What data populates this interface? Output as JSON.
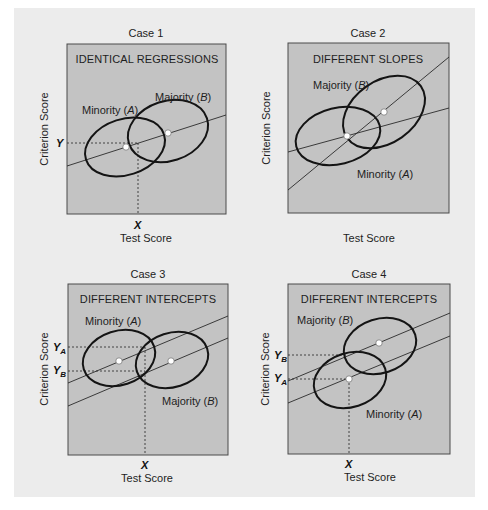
{
  "figure": {
    "panels": [
      {
        "id": "case1",
        "case_label": "Case 1",
        "heading": "IDENTICAL REGRESSIONS",
        "minority_label": "Minority (",
        "minority_letter": "A",
        "majority_label": "Majority (",
        "majority_letter": "B",
        "close_paren": ")",
        "x_axis_label": "Test Score",
        "y_axis_label": "Criterion Score",
        "x_marker": "X",
        "y_marker": "Y"
      },
      {
        "id": "case2",
        "case_label": "Case 2",
        "heading": "DIFFERENT SLOPES",
        "minority_label": "Minority (",
        "minority_letter": "A",
        "majority_label": "Majority (",
        "majority_letter": "B",
        "close_paren": ")",
        "x_axis_label": "Test Score",
        "y_axis_label": "Criterion Score"
      },
      {
        "id": "case3",
        "case_label": "Case 3",
        "heading": "DIFFERENT INTERCEPTS",
        "minority_label": "Minority (",
        "minority_letter": "A",
        "majority_label": "Majority (",
        "majority_letter": "B",
        "close_paren": ")",
        "x_axis_label": "Test Score",
        "y_axis_label": "Criterion Score",
        "x_marker": "X",
        "y_marker_main": "Y",
        "y_marker_a_sub": "A",
        "y_marker_b_sub": "B"
      },
      {
        "id": "case4",
        "case_label": "Case 4",
        "heading": "DIFFERENT INTERCEPTS",
        "minority_label": "Minority (",
        "minority_letter": "A",
        "majority_label": "Majority (",
        "majority_letter": "B",
        "close_paren": ")",
        "x_axis_label": "Test Score",
        "y_axis_label": "Criterion Score",
        "x_marker": "X",
        "y_marker_main": "Y",
        "y_marker_a_sub": "A",
        "y_marker_b_sub": "B"
      }
    ],
    "colors": {
      "outer_background": "#ececec",
      "plot_background": "#c3c3c3",
      "ellipse_stroke": "#141414",
      "line_stroke": "#2a2a2a",
      "mean_dot": "#ffffff"
    }
  }
}
